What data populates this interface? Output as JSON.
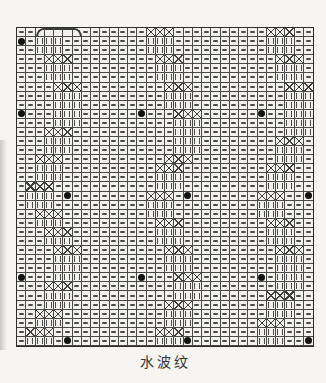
{
  "caption": {
    "text": "水波纹"
  },
  "chart_data": {
    "type": "table",
    "subtype": "knitting-stitch-chart",
    "columns": 32,
    "rows_count": 35,
    "legend": {
      "-": "purl stitch (horizontal dash)",
      "i": "knit stitch (vertical bars)",
      "x": "crossing / twist symbol at wave shift",
      "(": "fan arc left end",
      "n": "fan arc middle",
      ")": "fan arc right end",
      "o": "black repeat-marker dot"
    },
    "rows": [
      "--(nnn)-------xxx----------xxx--",
      "o-iii---------iii----------iii--",
      "--iii---------iii----------iii--",
      "---xxx---------xxx----------xxx-",
      "---iii---------iii----------iii-",
      "---iii---------iii----------iii-",
      "----xxx---------xxx----------xxx",
      "----iii---------iii----------iii",
      "----iii---------iii----------iii",
      "o---iii------o---xxx------o--iii",
      "----iii----------iii---------iii",
      "---xxx-----------iii---------iii",
      "---iii-----------iii--------xxx-",
      "---iii-----------iii--------iii-",
      "--xxx-----------xxx---------iii-",
      "--iii----------xxx---------xxx--",
      "--iii----------iii---------iii--",
      "-xxx-----------iii---------iii--",
      "-iii-o--------xxx-o-------xxx--o",
      "-iii----------iii---------iii---",
      "--xxx---------iii---------iii---",
      "--iii----------xxx---------xxx--",
      "---xxx---------iii---------iii--",
      "---iii---------iii---------iii--",
      "----xxx---------xxx---------xxx-",
      "----iii---------iii---------iii-",
      "----iii---------iii---------iii-",
      "o---iii------o---xxx------o-iii-",
      "---xxx-----------iii--------iii-",
      "---iii-----------iii-------xxx--",
      "---iii----------xxx--------iii--",
      "--xxx-----------iii--------iii--",
      "--iii-----------iii-------xxx---",
      "-xxx-----------xxx--------iii---",
      "-iii-o---------iiio-------iii--o"
    ],
    "colors": {
      "paper": "#f6f5f2",
      "grid_background": "#f3f2ee",
      "grid_line": "#4a4a4a",
      "frame": "#2e2e2e",
      "symbol": "#4b4b4b",
      "dot": "#121212",
      "caption_text": "#333333"
    }
  }
}
